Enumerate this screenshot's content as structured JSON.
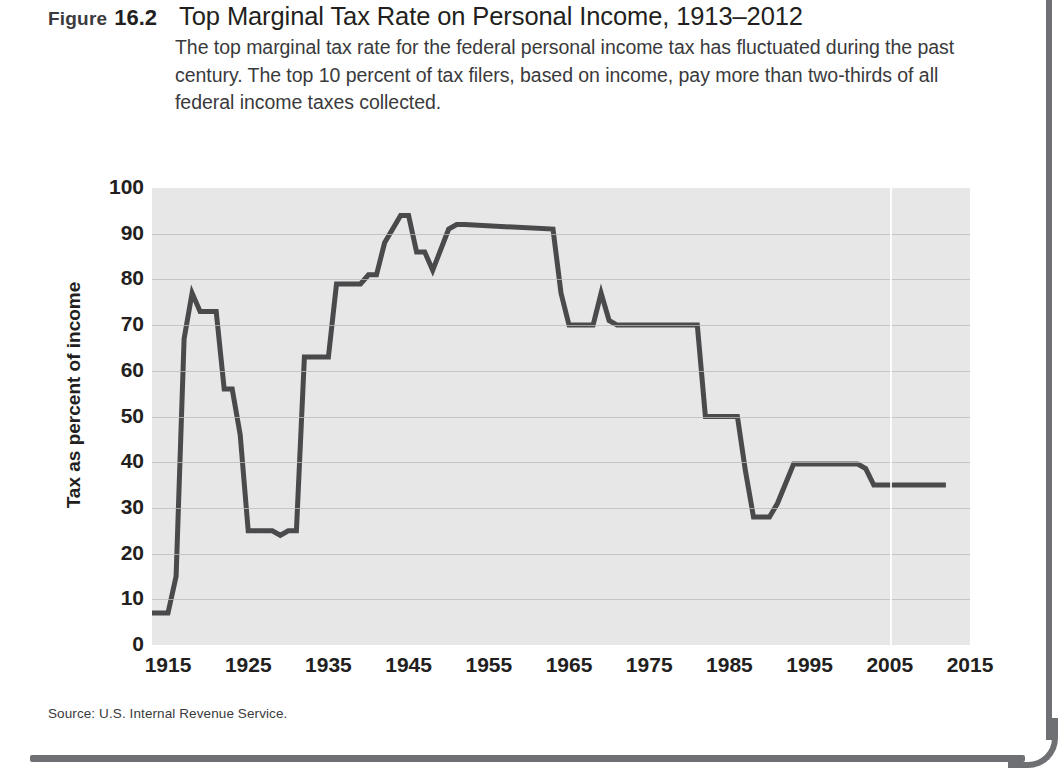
{
  "figure": {
    "label_word": "Figure",
    "number": "16.2",
    "title": "Top Marginal Tax Rate on Personal Income, 1913–2012",
    "description": "The top marginal tax rate for the federal personal income tax has fluctuated during the past century. The top 10 percent of tax filers, based on income, pay more than two-thirds of all federal income taxes collected.",
    "source": "Source: U.S. Internal Revenue Service."
  },
  "colors": {
    "line": "#4a4a4c",
    "plot_background": "#e7e7e7",
    "gridline": "#b9b9b9",
    "text": "#231f20",
    "rule": "#6f7073"
  },
  "chart_data": {
    "type": "line",
    "title": "Top Marginal Tax Rate on Personal Income, 1913–2012",
    "xlabel": "",
    "ylabel": "Tax as percent of income",
    "xlim": [
      1913,
      2015
    ],
    "ylim": [
      0,
      100
    ],
    "grid": true,
    "legend": "none",
    "yticks": [
      0,
      10,
      20,
      30,
      40,
      50,
      60,
      70,
      80,
      90,
      100
    ],
    "xticks": [
      1915,
      1925,
      1935,
      1945,
      1955,
      1965,
      1975,
      1985,
      1995,
      2005,
      2015
    ],
    "series": [
      {
        "name": "Top marginal tax rate",
        "x": [
          1913,
          1915,
          1916,
          1917,
          1918,
          1919,
          1921,
          1922,
          1923,
          1924,
          1925,
          1928,
          1929,
          1930,
          1931,
          1932,
          1935,
          1936,
          1939,
          1940,
          1941,
          1942,
          1944,
          1945,
          1946,
          1947,
          1948,
          1950,
          1951,
          1952,
          1963,
          1964,
          1965,
          1968,
          1969,
          1970,
          1971,
          1981,
          1982,
          1986,
          1987,
          1988,
          1990,
          1991,
          1993,
          2001,
          2002,
          2003,
          2012
        ],
        "values": [
          7,
          7,
          15,
          67,
          77,
          73,
          73,
          56,
          56,
          46,
          25,
          25,
          24,
          25,
          25,
          63,
          63,
          79,
          79,
          81,
          81,
          88,
          94,
          94,
          86,
          86,
          82,
          91,
          92,
          92,
          91,
          77,
          70,
          70,
          77,
          71,
          70,
          70,
          50,
          50,
          38,
          28,
          28,
          31,
          39.6,
          39.6,
          38.6,
          35,
          35
        ]
      }
    ]
  }
}
